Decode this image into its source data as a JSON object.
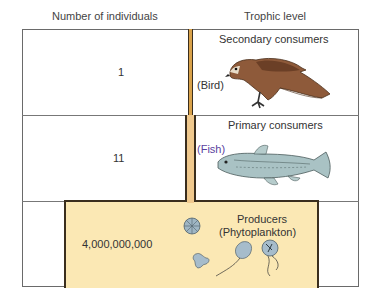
{
  "headers": {
    "left": "Number of individuals",
    "right": "Trophic level"
  },
  "levels": [
    {
      "count": "1",
      "trophic_level": "Secondary  consumers",
      "organism": "(Bird)",
      "illustration": "hawk-icon"
    },
    {
      "count": "11",
      "trophic_level": "Primary consumers",
      "organism": "(Fish)",
      "illustration": "fish-icon"
    },
    {
      "count": "4,000,000,000",
      "trophic_level": "Producers",
      "organism": "(Phytoplankton)",
      "illustration": "phytoplankton-icon"
    }
  ],
  "colors": {
    "secondary_bar": "#d9a24a",
    "primary_bar": "#f0c98e",
    "producer_bar": "#fbe8b4",
    "outline": "#3a2e1e"
  }
}
